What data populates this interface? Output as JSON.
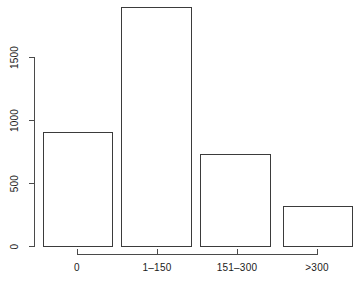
{
  "chart_data": {
    "type": "bar",
    "title": "",
    "subtitle": "",
    "xlabel": "",
    "ylabel": "",
    "categories": [
      "0",
      "1–150",
      "151–300",
      ">300"
    ],
    "values": [
      913,
      1905,
      738,
      325
    ],
    "series": [
      {
        "name": "count",
        "values": [
          913,
          1905,
          738,
          325
        ]
      }
    ],
    "ylim": [
      0,
      1905
    ],
    "yticks": [
      0,
      500,
      1000,
      1500
    ],
    "ytick_labels": [
      "0",
      "500",
      "1000",
      "1500"
    ],
    "xtick_labels": [
      "0",
      "1–150",
      "151–300",
      ">300"
    ],
    "grid": false,
    "legend": null,
    "legend_position": "none",
    "bar_fill_color": "#ffffff",
    "bar_border_color": "#3b3b3b",
    "axis_color": "#4a4a4a",
    "text_color": "#1a1a1a",
    "background_color": "#ffffff",
    "annotations": []
  },
  "axis": {
    "y_ticks": [
      {
        "label": "0",
        "value": 0
      },
      {
        "label": "500",
        "value": 500
      },
      {
        "label": "1000",
        "value": 1000
      },
      {
        "label": "1500",
        "value": 1500
      }
    ],
    "x_ticks": [
      {
        "label": "0"
      },
      {
        "label": "1–150"
      },
      {
        "label": "151–300"
      },
      {
        "label": ">300"
      }
    ]
  }
}
